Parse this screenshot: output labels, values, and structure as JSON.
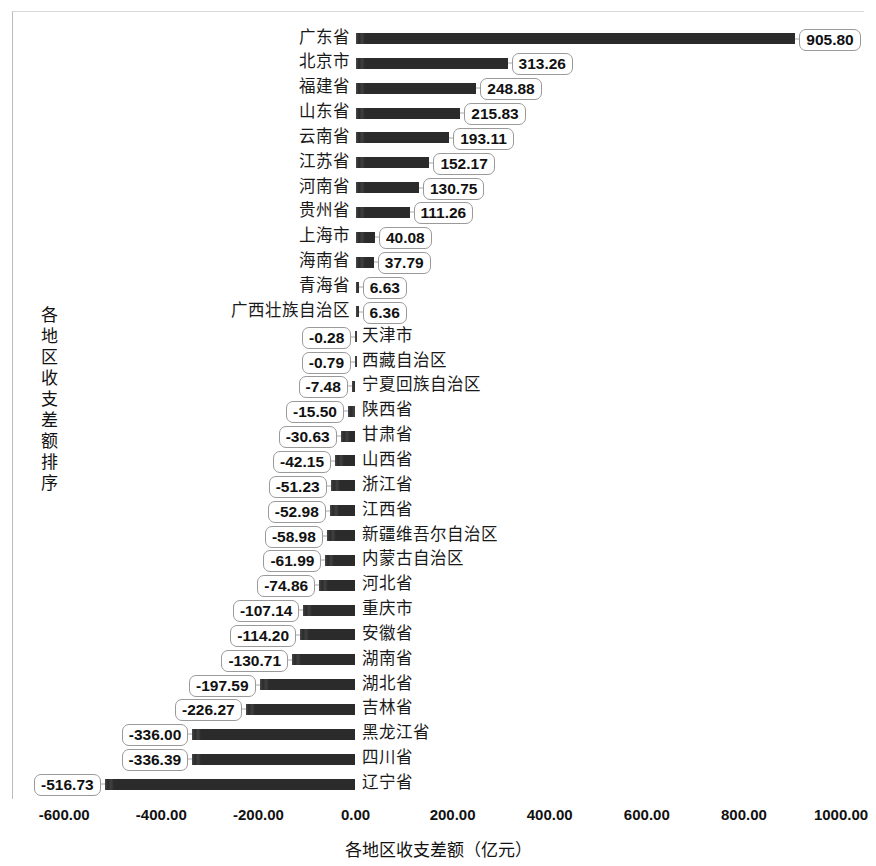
{
  "chart_data": {
    "type": "bar",
    "orientation": "horizontal",
    "title": "",
    "xlabel": "各地区收支差额（亿元）",
    "ylabel": "各地区收支差额排序",
    "xlim": [
      -600,
      1000
    ],
    "xtick_step": 200,
    "grid": false,
    "legend": null,
    "bar_color": "#2b2b2b",
    "categories": [
      "广东省",
      "北京市",
      "福建省",
      "山东省",
      "云南省",
      "江苏省",
      "河南省",
      "贵州省",
      "上海市",
      "海南省",
      "青海省",
      "广西壮族自治区",
      "天津市",
      "西藏自治区",
      "宁夏回族自治区",
      "陕西省",
      "甘肃省",
      "山西省",
      "浙江省",
      "江西省",
      "新疆维吾尔自治区",
      "内蒙古自治区",
      "河北省",
      "重庆市",
      "安徽省",
      "湖南省",
      "湖北省",
      "吉林省",
      "黑龙江省",
      "四川省",
      "辽宁省"
    ],
    "values": [
      905.8,
      313.26,
      248.88,
      215.83,
      193.11,
      152.17,
      130.75,
      111.26,
      40.08,
      37.79,
      6.63,
      6.36,
      -0.28,
      -0.79,
      -7.48,
      -15.5,
      -30.63,
      -42.15,
      -51.23,
      -52.98,
      -58.98,
      -61.99,
      -74.86,
      -107.14,
      -114.2,
      -130.71,
      -197.59,
      -226.27,
      -336.0,
      -336.39,
      -516.73
    ],
    "value_labels": [
      "905.80",
      "313.26",
      "248.88",
      "215.83",
      "193.11",
      "152.17",
      "130.75",
      "111.26",
      "40.08",
      "37.79",
      "6.63",
      "6.36",
      "-0.28",
      "-0.79",
      "-7.48",
      "-15.50",
      "-30.63",
      "-42.15",
      "-51.23",
      "-52.98",
      "-58.98",
      "-61.99",
      "-74.86",
      "-107.14",
      "-114.20",
      "-130.71",
      "-197.59",
      "-226.27",
      "-336.00",
      "-336.39",
      "-516.73"
    ],
    "xticklabels": [
      "-600.00",
      "-400.00",
      "-200.00",
      "0.00",
      "200.00",
      "400.00",
      "600.00",
      "800.00",
      "1000.00"
    ],
    "xtickvalues": [
      -600,
      -400,
      -200,
      0,
      200,
      400,
      600,
      800,
      1000
    ]
  }
}
